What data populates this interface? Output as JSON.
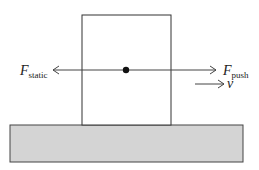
{
  "diagram": {
    "type": "free-body diagram",
    "labels": {
      "static_force_main": "F",
      "static_force_sub": "static",
      "push_force_main": "F",
      "push_force_sub": "push",
      "velocity": "v"
    },
    "colors": {
      "stroke": "#333333",
      "ground_fill": "#d4d4d4",
      "box_fill": "#ffffff",
      "dot": "#111111"
    }
  }
}
